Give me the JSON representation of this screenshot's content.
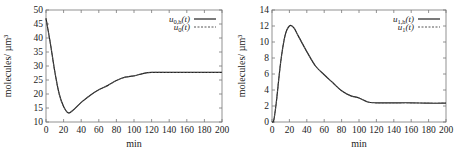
{
  "chart_data": [
    {
      "type": "line",
      "title": "",
      "xlabel": "min",
      "ylabel": "molecules/ µm³",
      "xlim": [
        0,
        200
      ],
      "ylim": [
        10,
        50
      ],
      "xticks": [
        0,
        20,
        40,
        60,
        80,
        100,
        120,
        140,
        160,
        180,
        200
      ],
      "yticks": [
        10,
        15,
        20,
        25,
        30,
        35,
        40,
        45,
        50
      ],
      "grid": false,
      "legend_position": "top-right",
      "series": [
        {
          "name": "u0,h(t)",
          "style": "solid",
          "x": [
            0,
            5,
            10,
            15,
            20,
            25,
            30,
            40,
            50,
            60,
            70,
            80,
            90,
            100,
            110,
            120,
            140,
            160,
            180,
            200
          ],
          "values": [
            47,
            38,
            28,
            20,
            15.5,
            13.3,
            14,
            17,
            19.5,
            21.5,
            23,
            24.8,
            26,
            26.5,
            27.3,
            27.7,
            27.7,
            27.7,
            27.7,
            27.7
          ]
        },
        {
          "name": "u0(t)",
          "style": "dashed",
          "x": [
            0,
            5,
            10,
            15,
            20,
            25,
            30,
            40,
            50,
            60,
            70,
            80,
            90,
            100,
            110,
            120,
            140,
            160,
            180,
            200
          ],
          "values": [
            47,
            38,
            28,
            20,
            15.5,
            13.3,
            14,
            17,
            19.5,
            21.5,
            23,
            24.8,
            26,
            26.5,
            27.3,
            27.7,
            27.7,
            27.7,
            27.7,
            27.7
          ]
        }
      ]
    },
    {
      "type": "line",
      "title": "",
      "xlabel": "min",
      "ylabel": "molecules/ µm³",
      "xlim": [
        0,
        200
      ],
      "ylim": [
        0,
        14
      ],
      "xticks": [
        0,
        20,
        40,
        60,
        80,
        100,
        120,
        140,
        160,
        180,
        200
      ],
      "yticks": [
        0,
        2,
        4,
        6,
        8,
        10,
        12,
        14
      ],
      "grid": false,
      "legend_position": "top-right",
      "series": [
        {
          "name": "u1,h(t)",
          "style": "solid",
          "x": [
            0,
            2,
            5,
            10,
            15,
            20,
            25,
            30,
            40,
            50,
            60,
            70,
            80,
            90,
            100,
            110,
            120,
            140,
            160,
            180,
            200
          ],
          "values": [
            0,
            0.2,
            2.5,
            7.5,
            10.8,
            12,
            11.8,
            10.8,
            8.8,
            7.0,
            5.9,
            4.9,
            3.9,
            3.3,
            3.0,
            2.5,
            2.4,
            2.4,
            2.4,
            2.35,
            2.35
          ]
        },
        {
          "name": "u1(t)",
          "style": "dashed",
          "x": [
            0,
            2,
            5,
            10,
            15,
            20,
            25,
            30,
            40,
            50,
            60,
            70,
            80,
            90,
            100,
            110,
            120,
            140,
            160,
            180,
            200
          ],
          "values": [
            0,
            0.2,
            2.5,
            7.5,
            10.8,
            12,
            11.8,
            10.8,
            8.8,
            7.0,
            5.9,
            4.9,
            3.9,
            3.3,
            3.0,
            2.5,
            2.4,
            2.4,
            2.4,
            2.35,
            2.35
          ]
        }
      ]
    }
  ],
  "charts": [
    {
      "xlabel": "min",
      "ylabel": "molecules/ µm³",
      "legend": [
        {
          "base": "u",
          "sub": "0,h",
          "arg": "(t)"
        },
        {
          "base": "u",
          "sub": "0",
          "arg": "(t)"
        }
      ]
    },
    {
      "xlabel": "min",
      "ylabel": "molecules/ µm³",
      "legend": [
        {
          "base": "u",
          "sub": "1,h",
          "arg": "(t)"
        },
        {
          "base": "u",
          "sub": "1",
          "arg": "(t)"
        }
      ]
    }
  ]
}
